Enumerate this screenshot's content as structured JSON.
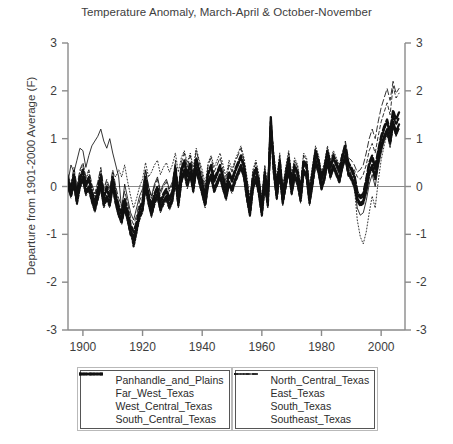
{
  "chart_data": {
    "type": "line",
    "title": "Temperature Anomaly, March-April & October-November",
    "xlabel": "",
    "ylabel": "Departure from 1901-2000 Average (F)",
    "xlim": [
      1895,
      2008
    ],
    "ylim": [
      -3,
      3
    ],
    "xticks": [
      1900,
      1920,
      1940,
      1960,
      1980,
      2000
    ],
    "yticks": [
      -3,
      -2,
      -1,
      0,
      1,
      2,
      3
    ],
    "xtick_labels": [
      "1900",
      "1920",
      "1940",
      "1960",
      "1980",
      "2000"
    ],
    "ytick_labels": [
      "3",
      "2",
      "1",
      "0",
      "-1",
      "-2",
      "-3"
    ],
    "ytick_labels_right": [
      "3",
      "2",
      "1",
      "0",
      "-1",
      "-2",
      "-3"
    ],
    "grid": false,
    "zero_line": true,
    "legend_position": "below-plot",
    "x": [
      1895,
      1896,
      1897,
      1898,
      1899,
      1900,
      1901,
      1902,
      1903,
      1904,
      1905,
      1906,
      1907,
      1908,
      1909,
      1910,
      1911,
      1912,
      1913,
      1914,
      1915,
      1916,
      1917,
      1918,
      1919,
      1920,
      1921,
      1922,
      1923,
      1924,
      1925,
      1926,
      1927,
      1928,
      1929,
      1930,
      1931,
      1932,
      1933,
      1934,
      1935,
      1936,
      1937,
      1938,
      1939,
      1940,
      1941,
      1942,
      1943,
      1944,
      1945,
      1946,
      1947,
      1948,
      1949,
      1950,
      1951,
      1952,
      1953,
      1954,
      1955,
      1956,
      1957,
      1958,
      1959,
      1960,
      1961,
      1962,
      1963,
      1964,
      1965,
      1966,
      1967,
      1968,
      1969,
      1970,
      1971,
      1972,
      1973,
      1974,
      1975,
      1976,
      1977,
      1978,
      1979,
      1980,
      1981,
      1982,
      1983,
      1984,
      1985,
      1986,
      1987,
      1988,
      1989,
      1990,
      1991,
      1992,
      1993,
      1994,
      1995,
      1996,
      1997,
      1998,
      1999,
      2000,
      2001,
      2002,
      2003,
      2004,
      2005,
      2006
    ],
    "series": [
      {
        "name": "Panhandle_and_Plains",
        "style": "solid",
        "width": "thick",
        "color": "#111111",
        "values": [
          0.05,
          -0.15,
          0.1,
          -0.3,
          0.05,
          0.2,
          -0.1,
          0.0,
          -0.25,
          -0.45,
          -0.2,
          0.05,
          -0.35,
          -0.2,
          -0.35,
          0.05,
          -0.3,
          -0.55,
          -0.7,
          -0.4,
          -0.65,
          -0.95,
          -1.05,
          -0.85,
          -0.6,
          -0.45,
          0.05,
          -0.3,
          -0.55,
          -0.3,
          -0.15,
          -0.45,
          -0.3,
          -0.2,
          -0.4,
          -0.25,
          0.2,
          -0.35,
          0.15,
          0.35,
          0.05,
          0.3,
          -0.05,
          0.4,
          0.15,
          -0.1,
          -0.35,
          0.1,
          0.25,
          -0.05,
          0.1,
          0.25,
          0.0,
          -0.2,
          0.1,
          -0.05,
          0.15,
          0.3,
          0.45,
          0.25,
          -0.2,
          -0.55,
          0.0,
          0.2,
          -0.1,
          -0.55,
          0.1,
          -0.35,
          1.45,
          0.35,
          -0.2,
          0.35,
          -0.3,
          0.05,
          0.4,
          -0.1,
          0.25,
          0.1,
          -0.25,
          0.35,
          0.25,
          -0.3,
          0.1,
          0.55,
          0.35,
          0.0,
          0.2,
          0.55,
          0.25,
          0.45,
          0.3,
          0.15,
          0.45,
          0.65,
          0.3,
          0.2,
          0.05,
          -0.25,
          -0.35,
          -0.3,
          -0.05,
          0.3,
          0.45,
          0.2,
          0.55,
          0.85,
          1.05,
          1.2,
          0.95,
          1.35,
          1.15,
          1.3
        ]
      },
      {
        "name": "Far_West_Texas",
        "style": "dotted",
        "width": "thick",
        "color": "#111111",
        "values": [
          0.1,
          -0.1,
          0.2,
          -0.2,
          0.15,
          0.3,
          0.0,
          0.15,
          -0.15,
          -0.35,
          -0.1,
          0.2,
          -0.25,
          -0.05,
          -0.25,
          0.15,
          -0.2,
          -0.45,
          -0.6,
          -0.3,
          -0.55,
          -0.85,
          -1.25,
          -0.95,
          -0.5,
          -0.35,
          0.15,
          -0.2,
          -0.45,
          -0.2,
          -0.05,
          -0.35,
          -0.2,
          -0.1,
          -0.3,
          -0.15,
          0.35,
          -0.25,
          0.3,
          0.5,
          0.2,
          0.45,
          0.1,
          0.55,
          0.3,
          0.05,
          -0.25,
          0.25,
          0.4,
          0.1,
          0.25,
          0.4,
          0.15,
          -0.1,
          0.25,
          0.1,
          0.3,
          0.45,
          0.6,
          0.4,
          -0.05,
          -0.45,
          0.15,
          0.35,
          0.05,
          -0.45,
          0.25,
          -0.25,
          1.25,
          0.5,
          -0.05,
          0.5,
          -0.2,
          0.2,
          0.55,
          0.05,
          0.4,
          0.25,
          -0.15,
          0.5,
          0.4,
          -0.2,
          0.25,
          0.7,
          0.5,
          0.15,
          0.35,
          0.7,
          0.4,
          0.6,
          0.45,
          0.3,
          0.6,
          0.8,
          0.45,
          0.35,
          0.2,
          -0.15,
          -0.25,
          -0.2,
          0.1,
          0.45,
          0.6,
          0.35,
          0.7,
          1.0,
          1.2,
          1.35,
          1.1,
          1.5,
          1.3,
          1.45
        ]
      },
      {
        "name": "West_Central_Texas",
        "style": "dashed-short",
        "width": "thick",
        "color": "#111111",
        "values": [
          0.0,
          -0.2,
          0.05,
          -0.35,
          0.0,
          0.15,
          -0.15,
          -0.05,
          -0.3,
          -0.5,
          -0.25,
          0.0,
          -0.4,
          -0.25,
          -0.4,
          0.0,
          -0.35,
          -0.6,
          -0.75,
          -0.45,
          -0.7,
          -1.0,
          -1.1,
          -0.9,
          -0.65,
          -0.5,
          0.0,
          -0.35,
          -0.6,
          -0.35,
          -0.2,
          -0.5,
          -0.35,
          -0.25,
          -0.45,
          -0.3,
          0.15,
          -0.4,
          0.1,
          0.3,
          0.0,
          0.25,
          -0.1,
          0.35,
          0.1,
          -0.15,
          -0.4,
          0.05,
          0.2,
          -0.1,
          0.05,
          0.2,
          -0.05,
          -0.25,
          0.05,
          -0.1,
          0.1,
          0.25,
          0.4,
          0.2,
          -0.25,
          -0.6,
          -0.05,
          0.15,
          -0.15,
          -0.6,
          0.05,
          -0.4,
          1.35,
          0.3,
          -0.25,
          0.3,
          -0.35,
          0.0,
          0.35,
          -0.15,
          0.2,
          0.05,
          -0.3,
          0.3,
          0.2,
          -0.35,
          0.05,
          0.5,
          0.3,
          -0.05,
          0.15,
          0.5,
          0.2,
          0.4,
          0.25,
          0.1,
          0.4,
          0.6,
          0.25,
          0.15,
          0.0,
          -0.3,
          -0.4,
          -0.35,
          -0.1,
          0.25,
          0.4,
          0.15,
          0.5,
          0.8,
          1.0,
          1.15,
          0.9,
          1.3,
          1.1,
          1.25
        ]
      },
      {
        "name": "South_Central_Texas",
        "style": "dashed-long",
        "width": "thick",
        "color": "#111111",
        "values": [
          0.15,
          -0.05,
          0.25,
          -0.15,
          0.2,
          0.35,
          0.05,
          0.2,
          -0.1,
          -0.3,
          -0.05,
          0.25,
          -0.2,
          0.0,
          -0.2,
          0.2,
          -0.15,
          -0.4,
          -0.55,
          -0.25,
          -0.5,
          -0.8,
          -0.95,
          -0.75,
          -0.45,
          -0.3,
          0.2,
          -0.15,
          -0.4,
          -0.15,
          0.0,
          -0.3,
          -0.15,
          -0.05,
          -0.25,
          -0.1,
          0.4,
          -0.2,
          0.35,
          0.55,
          0.25,
          0.5,
          0.15,
          0.6,
          0.35,
          0.1,
          -0.2,
          0.3,
          0.45,
          0.15,
          0.3,
          0.45,
          0.2,
          -0.05,
          0.3,
          0.15,
          0.35,
          0.5,
          0.65,
          0.45,
          0.0,
          -0.4,
          0.2,
          0.4,
          0.1,
          -0.4,
          0.3,
          -0.2,
          1.2,
          0.55,
          0.0,
          0.55,
          -0.15,
          0.25,
          0.6,
          0.1,
          0.45,
          0.3,
          -0.1,
          0.55,
          0.45,
          -0.15,
          0.3,
          0.75,
          0.55,
          0.2,
          0.4,
          0.75,
          0.45,
          0.65,
          0.5,
          0.35,
          0.65,
          0.85,
          0.5,
          0.4,
          0.25,
          -0.1,
          -0.2,
          -0.15,
          0.15,
          0.5,
          0.65,
          0.4,
          0.75,
          1.05,
          1.25,
          1.4,
          1.15,
          1.6,
          1.4,
          1.55
        ]
      },
      {
        "name": "North_Central_Texas",
        "style": "solid",
        "width": "thin",
        "color": "#111111",
        "values": [
          0.1,
          0.45,
          0.3,
          0.55,
          0.8,
          0.75,
          0.4,
          0.65,
          0.85,
          0.95,
          1.05,
          1.2,
          0.95,
          0.8,
          1.0,
          0.7,
          0.45,
          0.2,
          -0.5,
          0.05,
          -0.25,
          -0.55,
          -0.7,
          -0.45,
          -0.2,
          -0.05,
          0.35,
          0.0,
          -0.2,
          0.05,
          0.2,
          -0.1,
          0.05,
          0.15,
          -0.05,
          0.1,
          0.45,
          -0.05,
          0.4,
          0.55,
          0.3,
          0.5,
          0.2,
          0.6,
          0.35,
          0.15,
          -0.15,
          0.3,
          0.45,
          0.2,
          0.3,
          0.45,
          0.25,
          0.0,
          0.3,
          0.15,
          0.35,
          0.5,
          0.6,
          0.4,
          0.0,
          -0.45,
          0.1,
          0.3,
          0.05,
          -0.45,
          0.2,
          -0.3,
          1.1,
          0.45,
          -0.1,
          0.45,
          -0.25,
          0.15,
          0.5,
          0.0,
          0.35,
          0.2,
          -0.2,
          0.45,
          0.35,
          -0.25,
          0.2,
          0.65,
          0.45,
          0.1,
          0.3,
          0.65,
          0.35,
          0.55,
          0.4,
          0.25,
          0.55,
          0.7,
          0.4,
          0.25,
          0.05,
          -0.45,
          -0.6,
          -0.55,
          -0.3,
          0.05,
          0.25,
          0.0,
          0.4,
          0.7,
          0.95,
          1.1,
          0.85,
          1.25,
          1.05,
          1.2
        ]
      },
      {
        "name": "East_Texas",
        "style": "dotted-fine",
        "width": "thin",
        "color": "#111111",
        "values": [
          0.2,
          0.0,
          0.35,
          -0.05,
          0.3,
          0.45,
          0.15,
          0.3,
          0.0,
          -0.2,
          0.05,
          0.35,
          -0.1,
          0.1,
          -0.1,
          0.3,
          0.2,
          0.35,
          0.2,
          0.45,
          0.1,
          -0.2,
          -0.45,
          -0.25,
          0.0,
          0.15,
          0.5,
          0.2,
          0.3,
          0.45,
          0.55,
          0.25,
          0.4,
          0.5,
          0.3,
          0.45,
          0.7,
          0.3,
          0.6,
          0.75,
          0.5,
          0.7,
          0.4,
          0.8,
          0.55,
          0.35,
          0.05,
          0.5,
          0.65,
          0.4,
          0.55,
          0.7,
          0.45,
          0.2,
          0.55,
          0.35,
          0.55,
          0.7,
          0.85,
          0.6,
          0.2,
          -0.25,
          0.35,
          0.55,
          0.25,
          -0.25,
          0.45,
          -0.05,
          1.0,
          0.7,
          0.15,
          0.7,
          0.0,
          0.4,
          0.75,
          0.25,
          0.6,
          0.45,
          0.05,
          0.7,
          0.6,
          0.0,
          0.45,
          0.85,
          0.65,
          0.3,
          0.5,
          0.85,
          0.55,
          0.75,
          0.6,
          0.45,
          0.7,
          0.9,
          0.55,
          0.35,
          0.0,
          -0.7,
          -1.05,
          -1.2,
          -0.95,
          -0.55,
          -0.2,
          -0.45,
          0.1,
          0.55,
          0.85,
          1.1,
          0.8,
          1.25,
          1.05,
          1.2
        ]
      },
      {
        "name": "South_Texas",
        "style": "dashed-thin",
        "width": "thin",
        "color": "#111111",
        "values": [
          -0.05,
          -0.25,
          0.0,
          -0.4,
          -0.05,
          0.1,
          -0.2,
          -0.1,
          -0.35,
          -0.55,
          -0.3,
          -0.05,
          -0.45,
          -0.3,
          -0.45,
          -0.05,
          -0.4,
          -0.65,
          -0.8,
          -0.5,
          -0.75,
          -1.05,
          -1.15,
          -0.95,
          -0.7,
          -0.55,
          -0.05,
          -0.4,
          -0.65,
          -0.4,
          -0.25,
          -0.55,
          -0.4,
          -0.3,
          -0.5,
          -0.35,
          0.1,
          -0.45,
          0.05,
          0.25,
          -0.05,
          0.2,
          -0.15,
          0.3,
          0.05,
          -0.2,
          -0.45,
          0.0,
          0.15,
          -0.15,
          0.0,
          0.15,
          -0.1,
          -0.3,
          0.0,
          -0.15,
          0.05,
          0.2,
          0.35,
          0.15,
          -0.3,
          -0.65,
          -0.1,
          0.1,
          -0.2,
          -0.65,
          0.0,
          -0.45,
          1.3,
          0.25,
          -0.3,
          0.25,
          -0.4,
          -0.05,
          0.3,
          -0.2,
          0.15,
          0.0,
          -0.35,
          0.25,
          0.15,
          -0.4,
          0.0,
          0.45,
          0.25,
          -0.1,
          0.1,
          0.45,
          0.15,
          0.35,
          0.2,
          0.05,
          0.35,
          0.55,
          0.2,
          0.3,
          0.35,
          0.2,
          0.15,
          0.25,
          0.45,
          0.75,
          0.9,
          0.7,
          1.05,
          1.35,
          1.55,
          1.75,
          1.5,
          2.1,
          1.85,
          1.95
        ]
      },
      {
        "name": "Southeast_Texas",
        "style": "dashed-longthin",
        "width": "thin",
        "color": "#111111",
        "values": [
          0.25,
          0.05,
          0.4,
          0.0,
          0.35,
          0.5,
          0.2,
          0.35,
          0.05,
          -0.15,
          0.1,
          0.4,
          -0.05,
          0.15,
          -0.05,
          0.35,
          0.0,
          -0.25,
          -0.4,
          -0.1,
          -0.35,
          -0.65,
          -0.8,
          -0.6,
          -0.3,
          -0.15,
          0.35,
          0.0,
          -0.25,
          0.0,
          0.15,
          -0.15,
          0.0,
          0.1,
          -0.1,
          0.05,
          0.55,
          -0.05,
          0.5,
          0.7,
          0.4,
          0.65,
          0.3,
          0.75,
          0.5,
          0.25,
          -0.05,
          0.45,
          0.6,
          0.3,
          0.45,
          0.6,
          0.35,
          0.1,
          0.45,
          0.3,
          0.5,
          0.65,
          0.8,
          0.55,
          0.15,
          -0.3,
          0.3,
          0.5,
          0.2,
          -0.3,
          0.4,
          -0.1,
          1.15,
          0.65,
          0.1,
          0.65,
          -0.05,
          0.35,
          0.7,
          0.2,
          0.55,
          0.4,
          0.0,
          0.65,
          0.55,
          -0.05,
          0.4,
          0.8,
          0.6,
          0.25,
          0.45,
          0.8,
          0.5,
          0.7,
          0.55,
          0.4,
          0.7,
          0.95,
          0.6,
          0.55,
          0.45,
          0.3,
          0.35,
          0.45,
          0.7,
          1.0,
          1.2,
          1.0,
          1.35,
          1.65,
          1.85,
          2.05,
          1.8,
          2.2,
          1.95,
          2.05
        ]
      }
    ],
    "legend": {
      "left_box": [
        {
          "label": "Panhandle_and_Plains",
          "style": "solid",
          "width": "thick"
        },
        {
          "label": "Far_West_Texas",
          "style": "dotted",
          "width": "thick"
        },
        {
          "label": "West_Central_Texas",
          "style": "dashed-short",
          "width": "thick"
        },
        {
          "label": "South_Central_Texas",
          "style": "dashed-long",
          "width": "thick"
        }
      ],
      "right_box": [
        {
          "label": "North_Central_Texas",
          "style": "solid",
          "width": "thin"
        },
        {
          "label": "East_Texas",
          "style": "dotted-fine",
          "width": "thin"
        },
        {
          "label": "South_Texas",
          "style": "dashed-thin",
          "width": "thin"
        },
        {
          "label": "Southeast_Texas",
          "style": "dashed-longthin",
          "width": "thin"
        }
      ]
    },
    "colors": {
      "line": "#111111",
      "axis": "#8a8a8a",
      "text": "#3d3d3d",
      "background": "#ffffff"
    }
  }
}
